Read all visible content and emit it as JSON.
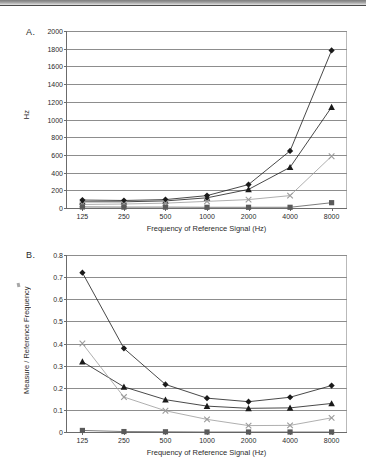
{
  "figure": {
    "panel_a_letter": "A.",
    "panel_b_letter": "B."
  },
  "chart_data": [
    {
      "panel": "A.",
      "type": "line",
      "title": "",
      "xlabel": "Frequency of Reference Signal (Hz)",
      "ylabel": "Hz",
      "categories": [
        "125",
        "250",
        "500",
        "1000",
        "2000",
        "4000",
        "8000"
      ],
      "x_tick_labels": [
        "125",
        "250",
        "500",
        "1000",
        "2000",
        "4000",
        "8000"
      ],
      "y_tick_labels": [
        "0",
        "200",
        "400",
        "600",
        "800",
        "1000",
        "1200",
        "1400",
        "1600",
        "1800",
        "2000"
      ],
      "ylim": [
        0,
        2000
      ],
      "y_tick_step": 200,
      "grid": true,
      "legend_position": "none",
      "series": [
        {
          "name": "diamond-series",
          "marker": "diamond",
          "color": "#1a1a1a",
          "values": [
            90,
            85,
            95,
            140,
            265,
            645,
            1780
          ]
        },
        {
          "name": "triangle-series",
          "marker": "triangle",
          "color": "#1a1a1a",
          "values": [
            70,
            70,
            80,
            115,
            210,
            460,
            1140
          ]
        },
        {
          "name": "cross-series",
          "marker": "cross",
          "color": "#9b9b9b",
          "values": [
            40,
            45,
            55,
            75,
            95,
            140,
            585
          ]
        },
        {
          "name": "square-series",
          "marker": "square",
          "color": "#5a5a5a",
          "values": [
            12,
            10,
            10,
            8,
            8,
            8,
            60
          ]
        }
      ]
    },
    {
      "panel": "B.",
      "type": "line",
      "title": "",
      "xlabel": "Frequency of Reference Signal (Hz)",
      "ylabel": "Measure / Reference Frequency",
      "categories": [
        "125",
        "250",
        "500",
        "1000",
        "2000",
        "4000",
        "8000"
      ],
      "x_tick_labels": [
        "125",
        "250",
        "500",
        "1000",
        "2000",
        "4000",
        "8000"
      ],
      "y_tick_labels": [
        "0",
        "0.1",
        "0.2",
        "0.3",
        "0.4",
        "0.5",
        "0.6",
        "0.7",
        "0.8"
      ],
      "ylim": [
        0,
        0.8
      ],
      "y_tick_step": 0.1,
      "grid": true,
      "legend_position": "none",
      "series": [
        {
          "name": "diamond-series",
          "marker": "diamond",
          "color": "#1a1a1a",
          "values": [
            0.72,
            0.378,
            0.215,
            0.153,
            0.137,
            0.157,
            0.21
          ]
        },
        {
          "name": "triangle-series",
          "marker": "triangle",
          "color": "#1a1a1a",
          "values": [
            0.318,
            0.204,
            0.146,
            0.117,
            0.107,
            0.109,
            0.129
          ]
        },
        {
          "name": "cross-series",
          "marker": "cross",
          "color": "#9b9b9b",
          "values": [
            0.4,
            0.158,
            0.096,
            0.057,
            0.029,
            0.03,
            0.064
          ]
        },
        {
          "name": "square-series",
          "marker": "square",
          "color": "#5a5a5a",
          "values": [
            0.007,
            0.002,
            0.001,
            0.0,
            0.0,
            0.0,
            0.0
          ]
        }
      ]
    }
  ]
}
